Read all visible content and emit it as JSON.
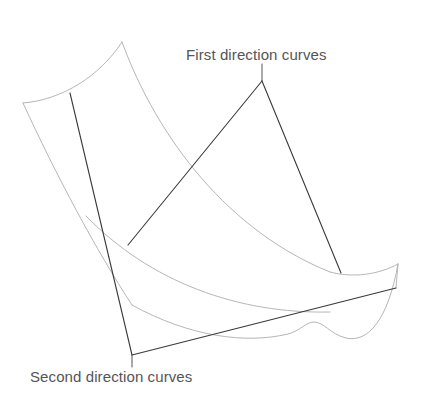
{
  "figure": {
    "background_color": "#ffffff",
    "width": 428,
    "height": 420
  },
  "labels": {
    "first": {
      "text": "First direction curves",
      "color": "#555555",
      "x": 186,
      "y": 46
    },
    "second": {
      "text": "Second direction curves",
      "color": "#555555",
      "x": 30,
      "y": 368
    }
  },
  "styles": {
    "first_direction_color": "#3a3a3a",
    "first_direction_width": 1.1,
    "second_direction_color": "#b6b6b6",
    "second_direction_width": 1.0,
    "leader_color": "#555555",
    "leader_width": 1.0
  },
  "chart_data": {
    "type": "line",
    "xlabel": "",
    "ylabel": "",
    "grid": false,
    "legend": "annotations",
    "annotations": [
      {
        "text": "First direction curves",
        "x": 186,
        "y": 46
      },
      {
        "text": "Second direction curves",
        "x": 30,
        "y": 368
      }
    ],
    "series": [
      {
        "name": "first-direction-curve-left",
        "family": "first",
        "color": "#3a3a3a",
        "style": "solid",
        "path": "M 70 93 L 132 355"
      },
      {
        "name": "first-direction-curve-middle-apex",
        "family": "first",
        "color": "#3a3a3a",
        "style": "solid",
        "path": "M 128 245 L 262 81"
      },
      {
        "name": "first-direction-curve-right",
        "family": "first",
        "color": "#3a3a3a",
        "style": "solid",
        "path": "M 262 81 L 341 273"
      },
      {
        "name": "first-direction-curve-bottom",
        "family": "first",
        "color": "#3a3a3a",
        "style": "solid",
        "path": "M 132 355 L 396 288"
      },
      {
        "name": "second-direction-curve-top",
        "family": "second",
        "color": "#b6b6b6",
        "style": "solid",
        "path": "M 23 103 C 62 100, 100 76, 122 42"
      },
      {
        "name": "second-direction-curve-upper-right",
        "family": "second",
        "color": "#b6b6b6",
        "style": "solid",
        "path": "M 122 42 C 158 140, 230 232, 330 272"
      },
      {
        "name": "second-direction-curve-right-tip",
        "family": "second",
        "color": "#b6b6b6",
        "style": "solid",
        "path": "M 330 272 C 352 278, 378 275, 398 264"
      },
      {
        "name": "second-direction-curve-left-edge",
        "family": "second",
        "color": "#b6b6b6",
        "style": "solid",
        "path": "M 23 103 C 56 175, 96 250, 132 305"
      },
      {
        "name": "second-direction-curve-inner",
        "family": "second",
        "color": "#b6b6b6",
        "style": "solid",
        "path": "M 86 216 C 150 282, 238 314, 330 312"
      },
      {
        "name": "second-direction-curve-bottom-boundary",
        "family": "second",
        "color": "#b6b6b6",
        "style": "solid",
        "path": "M 132 305 C 190 337, 246 344, 288 334 C 300 331, 306 322, 314 322 C 324 322, 330 334, 346 338 C 368 343, 388 320, 398 264"
      },
      {
        "name": "surface-right-edge",
        "family": "second",
        "color": "#b6b6b6",
        "style": "solid",
        "path": "M 398 264 L 396 288"
      }
    ],
    "leaders": [
      {
        "name": "leader-first-direction",
        "path": "M 262 64 L 262 81"
      },
      {
        "name": "leader-second-direction",
        "path": "M 132 355 L 132 367"
      }
    ]
  }
}
